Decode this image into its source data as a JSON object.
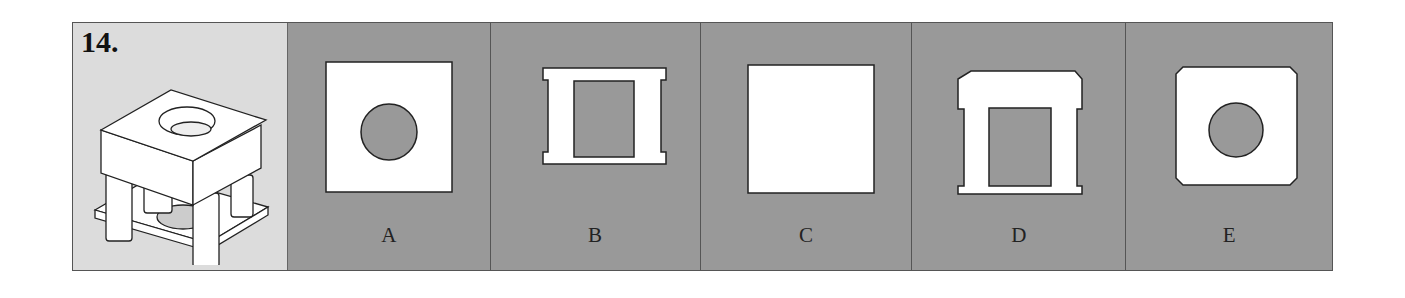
{
  "question": {
    "number": "14.",
    "object_icon": "isometric-block-with-pillars-and-hole"
  },
  "options": [
    {
      "label": "A",
      "shape": "square-with-circle-hole"
    },
    {
      "label": "B",
      "shape": "ibeam-frame-with-rect-hole"
    },
    {
      "label": "C",
      "shape": "plain-square"
    },
    {
      "label": "D",
      "shape": "chamfered-top-frame-with-rect-hole"
    },
    {
      "label": "E",
      "shape": "chamfered-square-with-circle-hole"
    }
  ],
  "colors": {
    "panel_bg": "#999999",
    "question_bg": "#dcdcdc",
    "shape_fill": "#ffffff",
    "stroke": "#222222"
  }
}
